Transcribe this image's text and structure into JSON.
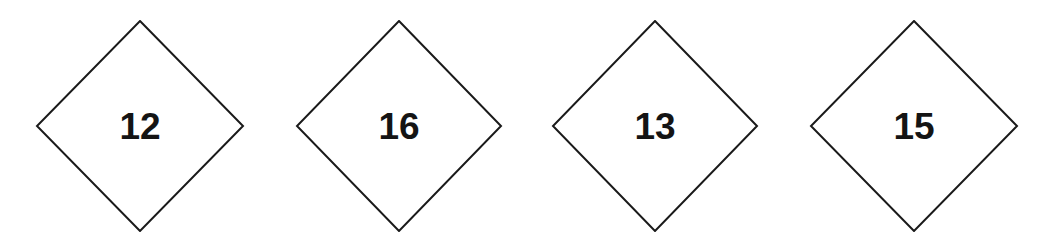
{
  "diagram": {
    "stroke_color": "#1a1a1a",
    "fill_color": "#ffffff",
    "diamonds": [
      {
        "label": "12",
        "center_x": 140,
        "center_y": 126
      },
      {
        "label": "16",
        "center_x": 399,
        "center_y": 126
      },
      {
        "label": "13",
        "center_x": 655,
        "center_y": 126
      },
      {
        "label": "15",
        "center_x": 914,
        "center_y": 126
      }
    ]
  }
}
